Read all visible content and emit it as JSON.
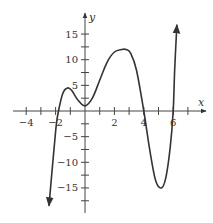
{
  "chart_data": {
    "type": "line",
    "title": "",
    "xlabel": "x",
    "ylabel": "y",
    "xlim": [
      -4.9,
      8.2
    ],
    "ylim": [
      -19.5,
      19
    ],
    "grid": false,
    "x_ticks": [
      -4,
      -3,
      -2,
      -1,
      1,
      2,
      3,
      4,
      5,
      6,
      7
    ],
    "x_tick_labels": [
      {
        "value": -4,
        "label": "−4"
      },
      {
        "value": -2,
        "label": "−2"
      },
      {
        "value": 2,
        "label": "2"
      },
      {
        "value": 4,
        "label": "4"
      },
      {
        "value": 6,
        "label": "6"
      }
    ],
    "y_ticks": [
      -17.5,
      -15,
      -12.5,
      -10,
      -7.5,
      -5,
      -2.5,
      2.5,
      5,
      7.5,
      10,
      12.5,
      15
    ],
    "y_tick_labels": [
      {
        "value": 15,
        "label": "15"
      },
      {
        "value": 10,
        "label": "10"
      },
      {
        "value": 5,
        "label": "5"
      },
      {
        "value": -5,
        "label": "−5"
      },
      {
        "value": -10,
        "label": "−10"
      },
      {
        "value": -15,
        "label": "−15"
      }
    ],
    "series": [
      {
        "name": "f(x)",
        "x": [
          -2.45,
          -2.0,
          -1.8,
          -1.5,
          -1.2,
          -0.9,
          -0.5,
          0.0,
          0.5,
          1.0,
          1.5,
          2.0,
          2.5,
          2.8,
          3.1,
          3.5,
          4.0,
          4.4,
          4.8,
          5.2,
          5.5,
          5.8,
          6.0,
          6.1,
          6.25
        ],
        "y": [
          -18.5,
          -4.0,
          0.0,
          3.5,
          4.5,
          4.0,
          2.2,
          1.0,
          2.5,
          6.0,
          9.5,
          11.5,
          12.0,
          12.0,
          11.3,
          8.0,
          0.0,
          -7.5,
          -13.5,
          -15.0,
          -13.0,
          -7.0,
          0.0,
          8.0,
          16.8
        ],
        "arrows": [
          "start",
          "end"
        ]
      }
    ],
    "key_points": {
      "x_intercepts": [
        -1.8,
        4.0,
        6.0
      ],
      "local_max": [
        [
          -1.2,
          4.5
        ],
        [
          2.8,
          12.0
        ]
      ],
      "local_min": [
        [
          0.0,
          1.0
        ],
        [
          5.2,
          -15.0
        ]
      ]
    }
  }
}
